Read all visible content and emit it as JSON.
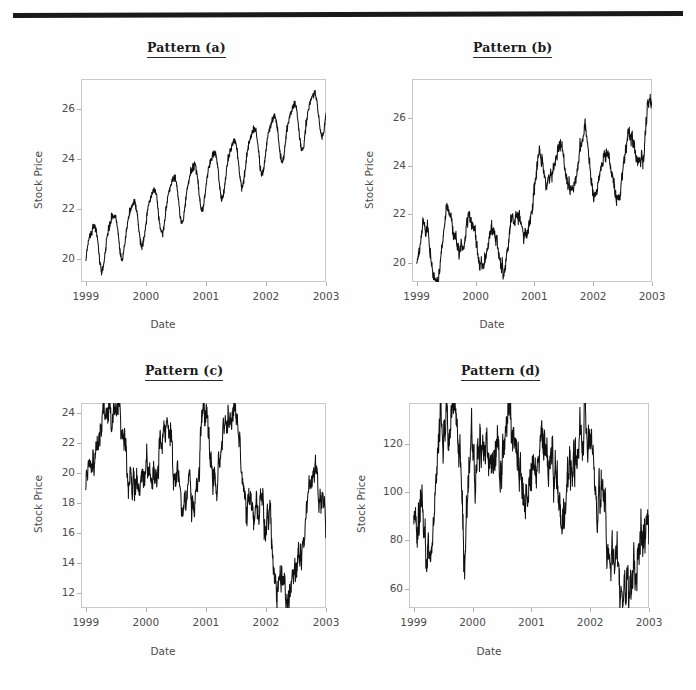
{
  "page": {
    "background": "#fefefe",
    "rule_color": "#1a1a1a"
  },
  "panels": [
    {
      "id": "a",
      "title": "Pattern (a)",
      "xlabel": "Date",
      "ylabel": "Stock Price",
      "xticks": [
        "1999",
        "2000",
        "2001",
        "2002",
        "2003"
      ],
      "yticks": [
        "20",
        "22",
        "24",
        "26"
      ]
    },
    {
      "id": "b",
      "title": "Pattern (b)",
      "xlabel": "Date",
      "ylabel": "Stock Price",
      "xticks": [
        "1999",
        "2000",
        "2001",
        "2002",
        "2003"
      ],
      "yticks": [
        "20",
        "22",
        "24",
        "26"
      ]
    },
    {
      "id": "c",
      "title": "Pattern (c)",
      "xlabel": "Date",
      "ylabel": "Stock Price",
      "xticks": [
        "1999",
        "2000",
        "2001",
        "2002",
        "2003"
      ],
      "yticks": [
        "12",
        "14",
        "16",
        "18",
        "20",
        "22",
        "24"
      ]
    },
    {
      "id": "d",
      "title": "Pattern (d)",
      "xlabel": "Date",
      "ylabel": "Stock Price",
      "xticks": [
        "1999",
        "2000",
        "2001",
        "2002",
        "2003"
      ],
      "yticks": [
        "60",
        "80",
        "100",
        "120"
      ]
    }
  ],
  "chart_data": [
    {
      "type": "line",
      "id": "a",
      "title": "Pattern (a)",
      "xlabel": "Date",
      "ylabel": "Stock Price",
      "xlim": [
        1998.92,
        2003.0
      ],
      "ylim": [
        19.1,
        27.2
      ],
      "xticks": [
        1999,
        2000,
        2001,
        2002,
        2003
      ],
      "yticks": [
        20,
        22,
        24,
        26
      ],
      "grid": false,
      "legend": null,
      "line_color": "#111111",
      "description": "Linear upward trend with strong regular seasonal oscillation (~4 cycles per year) plus small noise",
      "model": {
        "trend_intercept": 20.3,
        "trend_slope_per_year": 1.45,
        "seasonal_amplitude": 0.95,
        "seasonal_cycles_per_year": 3.0,
        "noise_sd": 0.08
      },
      "x": [
        1999.0,
        1999.25,
        1999.5,
        1999.75,
        2000.0,
        2000.25,
        2000.5,
        2000.75,
        2001.0,
        2001.25,
        2001.5,
        2001.75,
        2002.0,
        2002.25,
        2002.5,
        2002.75,
        2003.0
      ],
      "y": [
        20.2,
        19.5,
        21.9,
        20.0,
        22.4,
        20.6,
        23.2,
        21.4,
        23.2,
        21.9,
        24.9,
        22.5,
        25.6,
        23.6,
        26.2,
        24.3,
        26.0
      ]
    },
    {
      "type": "line",
      "id": "b",
      "title": "Pattern (b)",
      "xlabel": "Date",
      "ylabel": "Stock Price",
      "xlim": [
        1998.92,
        2003.0
      ],
      "ylim": [
        19.2,
        27.6
      ],
      "xticks": [
        1999,
        2000,
        2001,
        2002,
        2003
      ],
      "yticks": [
        20,
        22,
        24,
        26
      ],
      "grid": false,
      "legend": null,
      "line_color": "#111111",
      "description": "Stochastic upward drift (random-walk-like) with irregular seasonal swings, steeper rise after 2001",
      "model": {
        "drift_per_year": 1.5,
        "seasonal_amplitude": 1.0,
        "seasonal_cycles_per_year": 2.6,
        "noise_sd": 0.12,
        "random_walk_sd": 0.16
      },
      "x": [
        1999.0,
        1999.2,
        1999.45,
        1999.75,
        2000.05,
        2000.35,
        2000.55,
        2000.8,
        2001.0,
        2001.2,
        2001.4,
        2001.6,
        2001.85,
        2002.05,
        2002.3,
        2002.55,
        2002.85,
        2003.0
      ],
      "y": [
        20.2,
        21.8,
        22.3,
        19.6,
        20.1,
        23.5,
        22.2,
        24.2,
        21.4,
        23.4,
        22.0,
        25.5,
        24.0,
        26.1,
        23.4,
        25.2,
        27.3,
        26.2
      ]
    },
    {
      "type": "line",
      "id": "c",
      "title": "Pattern (c)",
      "xlabel": "Date",
      "ylabel": "Stock Price",
      "xlim": [
        1998.92,
        2003.0
      ],
      "ylim": [
        11.0,
        24.7
      ],
      "xticks": [
        1999,
        2000,
        2001,
        2002,
        2003
      ],
      "yticks": [
        12,
        14,
        16,
        18,
        20,
        22,
        24
      ],
      "grid": false,
      "legend": null,
      "line_color": "#111111",
      "description": "High-frequency noisy random walk: rises to ~24 in mid-1999, dips, peaks again near 2001 and mid-2001, then declines sharply to a low of ~11.4 in mid-2002 before recovering to ~20",
      "model": {
        "start_value": 19.9,
        "volatility_sd": 0.35,
        "peak_value": 24.2,
        "trough_value": 11.4
      },
      "x": [
        1999.0,
        1999.15,
        1999.4,
        1999.5,
        1999.75,
        2000.0,
        2000.15,
        2000.35,
        2000.6,
        2000.8,
        2001.0,
        2001.15,
        2001.3,
        2001.5,
        2001.65,
        2001.85,
        2002.0,
        2002.2,
        2002.35,
        2002.6,
        2002.8,
        2002.95,
        3000.0
      ],
      "y": [
        19.9,
        21.5,
        24.1,
        24.2,
        19.4,
        19.3,
        20.1,
        23.1,
        17.6,
        18.6,
        24.0,
        19.2,
        22.9,
        24.1,
        18.0,
        18.1,
        17.9,
        13.4,
        11.4,
        15.2,
        20.5,
        17.2,
        17.2
      ]
    },
    {
      "type": "line",
      "id": "d",
      "title": "Pattern (d)",
      "xlabel": "Date",
      "ylabel": "Stock Price",
      "xlim": [
        1998.92,
        2003.0
      ],
      "ylim": [
        52.0,
        137.0
      ],
      "xticks": [
        1999,
        2000,
        2001,
        2002,
        2003
      ],
      "yticks": [
        60,
        80,
        100,
        120
      ],
      "grid": false,
      "legend": null,
      "line_color": "#111111",
      "description": "Same noisy random-walk shape as pattern (c) but on a larger price scale; peaks ~134 in mid-1999 and ~130 in late 2000, troughs to ~54 in late 2002, recovering to ~80",
      "model": {
        "start_value": 90,
        "volatility_sd": 3.0,
        "peak_value": 134,
        "trough_value": 54
      },
      "x": [
        1999.0,
        1999.15,
        1999.3,
        1999.5,
        1999.7,
        1999.85,
        2000.0,
        2000.2,
        2000.45,
        2000.65,
        2000.9,
        2001.05,
        2001.3,
        2001.5,
        2001.7,
        2001.95,
        2002.15,
        2002.4,
        2002.65,
        2002.85,
        2003.0
      ],
      "y": [
        90,
        85,
        88,
        134,
        128,
        91,
        115,
        121,
        112,
        130,
        98,
        116,
        117,
        99,
        114,
        122,
        100,
        70,
        54,
        86,
        79
      ]
    }
  ]
}
